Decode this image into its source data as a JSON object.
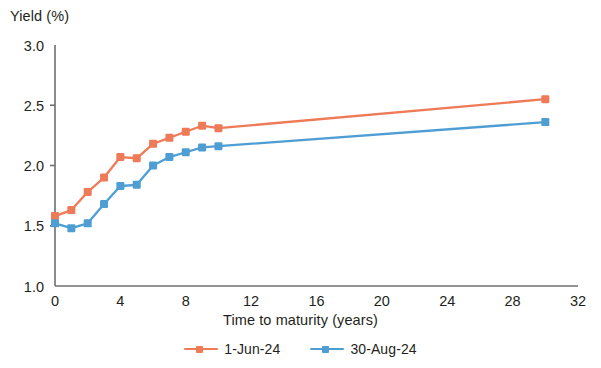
{
  "chart_data": {
    "type": "line",
    "title": "",
    "xlabel": "Time to maturity (years)",
    "ylabel": "Yield (%)",
    "xlim": [
      0,
      32
    ],
    "ylim": [
      1.0,
      3.0
    ],
    "xticks": [
      0,
      4,
      8,
      12,
      16,
      20,
      24,
      28,
      32
    ],
    "xtick_labels": [
      "0",
      "4",
      "8",
      "12",
      "16",
      "20",
      "24",
      "28",
      "32"
    ],
    "yticks": [
      1.0,
      1.5,
      2.0,
      2.5,
      3.0
    ],
    "ytick_labels": [
      "1.0",
      "1.5",
      "2.0",
      "2.5",
      "3.0"
    ],
    "grid": false,
    "legend_position": "bottom-center",
    "x": [
      0,
      1,
      2,
      3,
      4,
      5,
      6,
      7,
      8,
      9,
      10,
      30
    ],
    "series": [
      {
        "name": "1-Jun-24",
        "color": "#ee7a57",
        "values": [
          1.58,
          1.63,
          1.78,
          1.9,
          2.07,
          2.06,
          2.18,
          2.23,
          2.28,
          2.33,
          2.31,
          2.55
        ]
      },
      {
        "name": "30-Aug-24",
        "color": "#4e9ed4",
        "values": [
          1.52,
          1.48,
          1.52,
          1.68,
          1.83,
          1.84,
          2.0,
          2.07,
          2.11,
          2.15,
          2.16,
          2.36
        ]
      }
    ]
  },
  "axis": {
    "y_label": "Yield (%)",
    "x_label": "Time to maturity (years)"
  },
  "legend": {
    "items": [
      {
        "label": "1-Jun-24",
        "color": "#ee7a57"
      },
      {
        "label": "30-Aug-24",
        "color": "#4e9ed4"
      }
    ]
  },
  "colors": {
    "series_1": "#ee7a57",
    "series_2": "#4e9ed4",
    "axis": "#6d6e71",
    "text": "#231f20",
    "background": "#ffffff"
  }
}
